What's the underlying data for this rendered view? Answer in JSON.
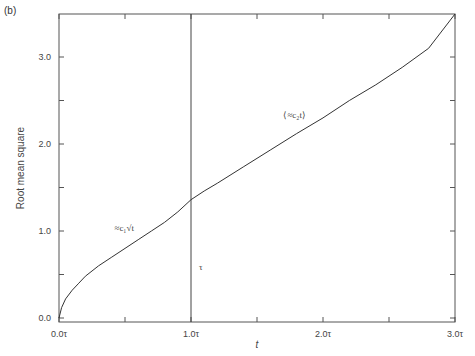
{
  "panel_label": "(b)",
  "chart_data": {
    "type": "line",
    "title": "",
    "panel_label": "(b)",
    "xlabel": "t",
    "ylabel": "Root mean square",
    "xlim": [
      0.0,
      3.0
    ],
    "ylim": [
      0.0,
      3.5
    ],
    "x_unit": "τ",
    "x_ticks": [
      {
        "value": 0.0,
        "label": "0.0τ"
      },
      {
        "value": 0.5,
        "label": ""
      },
      {
        "value": 1.0,
        "label": "1.0τ"
      },
      {
        "value": 1.5,
        "label": ""
      },
      {
        "value": 2.0,
        "label": "2.0τ"
      },
      {
        "value": 2.5,
        "label": ""
      },
      {
        "value": 3.0,
        "label": "3.0τ"
      }
    ],
    "y_ticks": [
      {
        "value": 0.0,
        "label": "0.0"
      },
      {
        "value": 0.5,
        "label": ""
      },
      {
        "value": 1.0,
        "label": "1.0"
      },
      {
        "value": 1.5,
        "label": ""
      },
      {
        "value": 2.0,
        "label": "2.0"
      },
      {
        "value": 2.5,
        "label": ""
      },
      {
        "value": 3.0,
        "label": "3.0"
      }
    ],
    "grid": false,
    "legend": null,
    "series": [
      {
        "name": "Root mean square",
        "x": [
          0.0,
          0.02,
          0.05,
          0.1,
          0.15,
          0.2,
          0.3,
          0.4,
          0.5,
          0.6,
          0.7,
          0.8,
          0.9,
          1.0,
          1.1,
          1.2,
          1.4,
          1.6,
          1.8,
          2.0,
          2.2,
          2.4,
          2.6,
          2.8,
          3.0
        ],
        "values": [
          0.0,
          0.12,
          0.22,
          0.32,
          0.4,
          0.48,
          0.6,
          0.7,
          0.8,
          0.9,
          1.0,
          1.1,
          1.22,
          1.36,
          1.46,
          1.55,
          1.74,
          1.93,
          2.12,
          2.3,
          2.5,
          2.68,
          2.88,
          3.1,
          3.5
        ]
      }
    ],
    "vertical_line": {
      "x": 1.0,
      "label": "τ",
      "label_y": 0.55
    },
    "annotations": [
      {
        "text": "≈c₁√t",
        "x": 0.42,
        "y": 1.0
      },
      {
        "text": "⟨≈c₂t⟩",
        "x": 1.7,
        "y": 2.3
      }
    ]
  }
}
